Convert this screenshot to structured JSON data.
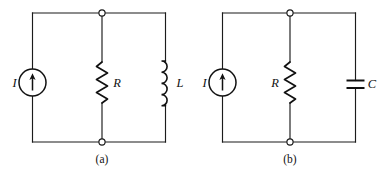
{
  "figure": {
    "kind": "electrical-circuit-diagram",
    "background_color": "#ffffff",
    "line_color": "#1b1b1b",
    "subfigures": [
      {
        "id": "a",
        "caption": "(a)",
        "description": "Current source in parallel with a resistor and an inductor",
        "elements": [
          {
            "type": "current-source",
            "label": "I",
            "direction": "up"
          },
          {
            "type": "resistor",
            "label": "R"
          },
          {
            "type": "inductor",
            "label": "L"
          }
        ]
      },
      {
        "id": "b",
        "caption": "(b)",
        "description": "Current source in parallel with a resistor and a capacitor",
        "elements": [
          {
            "type": "current-source",
            "label": "I",
            "direction": "up"
          },
          {
            "type": "resistor",
            "label": "R"
          },
          {
            "type": "capacitor",
            "label": "C"
          }
        ]
      }
    ]
  },
  "circuit_a": {
    "caption": "(a)",
    "source_label": "I",
    "resistor_label": "R",
    "inductor_label": "L"
  },
  "circuit_b": {
    "caption": "(b)",
    "source_label": "I",
    "resistor_label": "R",
    "capacitor_label": "C"
  }
}
